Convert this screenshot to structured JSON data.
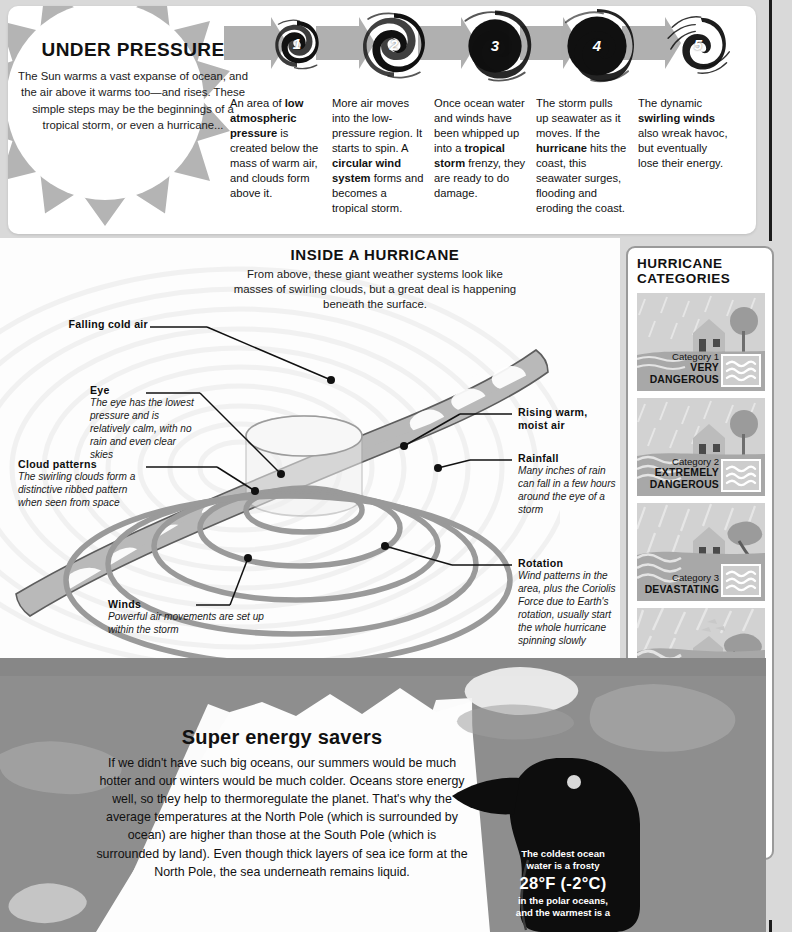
{
  "intro": {
    "title": "UNDER PRESSURE",
    "body": "The Sun warms a vast expanse of ocean, and the air above it warms too—and rises. These simple steps may be the beginnings of a tropical storm, or even a hurricane..."
  },
  "steps": [
    {
      "number": "1",
      "html": "An area of <b>low atmospheric pressure</b> is created below the mass of warm air, and clouds form above it."
    },
    {
      "number": "2",
      "html": "More air moves into the low-pressure region. It starts to spin. A <b>circular wind system</b> forms and becomes a tropical storm."
    },
    {
      "number": "3",
      "html": "Once ocean water and winds have been whipped up into a <b>tropical storm</b> frenzy, they are ready to do damage."
    },
    {
      "number": "4",
      "html": "The storm pulls up seawater as it moves. If the <b>hurricane</b> hits the coast, this seawater surges, flooding and eroding the coast."
    },
    {
      "number": "5",
      "html": "The dynamic <b>swirling winds</b> also wreak havoc, but eventually lose their energy."
    }
  ],
  "inside": {
    "title": "INSIDE A HURRICANE",
    "body": "From above, these giant weather systems look like masses of swirling clouds, but a great deal is happening beneath the surface."
  },
  "annotations": [
    {
      "title": "Falling cold air",
      "desc": ""
    },
    {
      "title": "Eye",
      "desc": "The eye has the lowest pressure and is relatively calm, with no rain and even clear skies"
    },
    {
      "title": "Cloud patterns",
      "desc": "The swirling clouds form a distinctive ribbed pattern when seen from space"
    },
    {
      "title": "Rising warm, moist air",
      "desc": ""
    },
    {
      "title": "Rainfall",
      "desc": "Many inches of rain can fall in a few hours around the eye of a storm"
    },
    {
      "title": "Rotation",
      "desc": "Wind patterns in the area, plus the Coriolis Force due to Earth's rotation, usually start the whole hurricane spinning slowly"
    },
    {
      "title": "Winds",
      "desc": "Powerful air movements are set up within the storm"
    }
  ],
  "categories": {
    "title": "HURRICANE CATEGORIES",
    "items": [
      {
        "number": "Category 1",
        "severity": "VERY DANGEROUS"
      },
      {
        "number": "Category 2",
        "severity": "EXTREMELY DANGEROUS"
      },
      {
        "number": "Category 3",
        "severity": "DEVASTATING"
      },
      {
        "number": "Category 4",
        "severity": "CATASTROPHIC"
      },
      {
        "number": "Category 5",
        "severity": "VERY CATASTROPHIC"
      }
    ]
  },
  "energy": {
    "title": "Super energy savers",
    "body": "If we didn't have such big oceans, our summers would be much hotter and our winters would be much colder. Oceans store energy well, so they help to thermoregulate the planet. That's why the average temperatures at the North Pole (which is surrounded by ocean) are higher than those at the South Pole (which is surrounded by land). Even though thick layers of sea ice form at the North Pole, the sea underneath remains liquid."
  },
  "penguin_callout": {
    "line1": "The coldest ocean",
    "line2": "water is a frosty",
    "big": "28°F (-2°C)",
    "line3": "in the polar oceans,",
    "line4": "and the warmest is a"
  },
  "colors": {
    "panel_white": "#ffffff",
    "sun_gray": "#b4b4b4",
    "arrow_gray": "#b0b0b0",
    "ocean_gray": "#8e8e8e",
    "card_gray": "#d2d2d2",
    "ink": "#111111"
  }
}
